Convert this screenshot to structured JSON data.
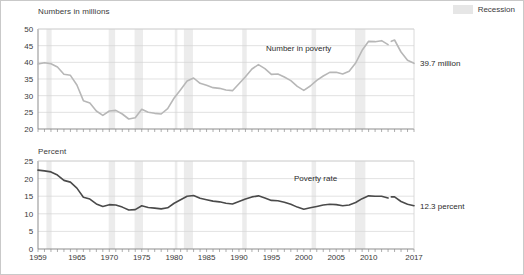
{
  "figure": {
    "legend": {
      "label": "Recession",
      "swatch_color": "#e6e6e6"
    }
  },
  "panels": {
    "top": {
      "axis_title": "Numbers in millions",
      "series_label": "Number in poverty",
      "end_note": "39.7 million",
      "line_color": "#b7b7b7"
    },
    "bottom": {
      "axis_title": "Percent",
      "series_label": "Poverty rate",
      "end_note": "12.3 percent",
      "line_color": "#4a4a4a"
    }
  },
  "chart_data": [
    {
      "type": "line",
      "id": "number-in-poverty",
      "title": "Number in poverty",
      "ylabel": "Numbers in millions",
      "xlabel": "",
      "ylim": [
        20,
        50
      ],
      "yticks": [
        20,
        25,
        30,
        35,
        40,
        45,
        50
      ],
      "xlim": [
        1959,
        2017
      ],
      "xticks": [
        1959,
        1965,
        1970,
        1975,
        1980,
        1985,
        1990,
        1995,
        2000,
        2005,
        2010,
        2017
      ],
      "grid": "horizontal",
      "legend_position": "top-right",
      "units": "millions",
      "annotations": [
        {
          "text": "39.7 million",
          "x": 2017,
          "y": 39.7
        }
      ],
      "x": [
        1959,
        1960,
        1961,
        1962,
        1963,
        1964,
        1965,
        1966,
        1967,
        1968,
        1969,
        1970,
        1971,
        1972,
        1973,
        1974,
        1975,
        1976,
        1977,
        1978,
        1979,
        1980,
        1981,
        1982,
        1983,
        1984,
        1985,
        1986,
        1987,
        1988,
        1989,
        1990,
        1991,
        1992,
        1993,
        1994,
        1995,
        1996,
        1997,
        1998,
        1999,
        2000,
        2001,
        2002,
        2003,
        2004,
        2005,
        2006,
        2007,
        2008,
        2009,
        2010,
        2011,
        2012,
        2013,
        2013.5,
        2014,
        2015,
        2016,
        2017
      ],
      "values": [
        39.5,
        39.9,
        39.6,
        38.6,
        36.4,
        36.1,
        33.2,
        28.5,
        27.8,
        25.4,
        24.1,
        25.4,
        25.6,
        24.5,
        23.0,
        23.4,
        25.9,
        25.0,
        24.7,
        24.5,
        26.1,
        29.3,
        31.8,
        34.4,
        35.3,
        33.7,
        33.1,
        32.4,
        32.2,
        31.7,
        31.5,
        33.6,
        35.7,
        38.0,
        39.3,
        38.1,
        36.4,
        36.5,
        35.6,
        34.5,
        32.8,
        31.6,
        32.9,
        34.6,
        35.9,
        37.0,
        37.0,
        36.5,
        37.3,
        39.8,
        43.6,
        46.3,
        46.2,
        46.5,
        45.3,
        46.3,
        46.7,
        43.1,
        40.6,
        39.7
      ],
      "series_break_at": 2013,
      "series_break_note": "2013 redesigned income questions (two estimates)"
    },
    {
      "type": "line",
      "id": "poverty-rate",
      "title": "Poverty rate",
      "ylabel": "Percent",
      "xlabel": "",
      "ylim": [
        0,
        25
      ],
      "yticks": [
        0,
        5,
        10,
        15,
        20,
        25
      ],
      "xlim": [
        1959,
        2017
      ],
      "xticks": [
        1959,
        1965,
        1970,
        1975,
        1980,
        1985,
        1990,
        1995,
        2000,
        2005,
        2010,
        2017
      ],
      "grid": "horizontal",
      "legend_position": "top-right",
      "units": "percent",
      "annotations": [
        {
          "text": "12.3 percent",
          "x": 2017,
          "y": 12.3
        }
      ],
      "x": [
        1959,
        1960,
        1961,
        1962,
        1963,
        1964,
        1965,
        1966,
        1967,
        1968,
        1969,
        1970,
        1971,
        1972,
        1973,
        1974,
        1975,
        1976,
        1977,
        1978,
        1979,
        1980,
        1981,
        1982,
        1983,
        1984,
        1985,
        1986,
        1987,
        1988,
        1989,
        1990,
        1991,
        1992,
        1993,
        1994,
        1995,
        1996,
        1997,
        1998,
        1999,
        2000,
        2001,
        2002,
        2003,
        2004,
        2005,
        2006,
        2007,
        2008,
        2009,
        2010,
        2011,
        2012,
        2013,
        2013.5,
        2014,
        2015,
        2016,
        2017
      ],
      "values": [
        22.4,
        22.2,
        21.9,
        21.0,
        19.5,
        19.0,
        17.3,
        14.7,
        14.2,
        12.8,
        12.1,
        12.6,
        12.5,
        11.9,
        11.1,
        11.2,
        12.3,
        11.8,
        11.6,
        11.4,
        11.7,
        13.0,
        14.0,
        15.0,
        15.2,
        14.4,
        14.0,
        13.6,
        13.4,
        13.0,
        12.8,
        13.5,
        14.2,
        14.8,
        15.1,
        14.5,
        13.8,
        13.7,
        13.3,
        12.7,
        11.9,
        11.3,
        11.7,
        12.1,
        12.5,
        12.7,
        12.6,
        12.3,
        12.5,
        13.2,
        14.3,
        15.1,
        15.0,
        15.0,
        14.5,
        14.8,
        14.8,
        13.5,
        12.7,
        12.3
      ],
      "series_break_at": 2013,
      "series_break_note": "2013 redesigned income questions (two estimates)"
    }
  ],
  "recessions": [
    {
      "start": 1960.3,
      "end": 1961.1
    },
    {
      "start": 1969.9,
      "end": 1970.9
    },
    {
      "start": 1973.9,
      "end": 1975.2
    },
    {
      "start": 1980.1,
      "end": 1980.5
    },
    {
      "start": 1981.5,
      "end": 1982.9
    },
    {
      "start": 1990.5,
      "end": 1991.2
    },
    {
      "start": 2001.2,
      "end": 2001.9
    },
    {
      "start": 2007.9,
      "end": 2009.5
    }
  ]
}
